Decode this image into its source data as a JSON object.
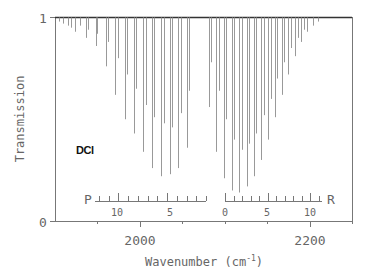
{
  "chart_data": {
    "type": "line",
    "subtype": "stick-spectrum",
    "title": "",
    "annotation": "DCl",
    "xlabel": "Wavenumber",
    "xlabel_unit_base": "cm",
    "xlabel_unit_exp": "-1",
    "ylabel": "Transmission",
    "xlim": [
      1900,
      2250
    ],
    "ylim": [
      0,
      1
    ],
    "x_ticks": [
      1950,
      2000,
      2050,
      2100,
      2150,
      2200,
      2250
    ],
    "x_tick_labels": [
      "2000",
      "2200"
    ],
    "x_tick_label_values": [
      2000,
      2200
    ],
    "y_tick_labels": [
      "0",
      "1"
    ],
    "grid": false,
    "branches": {
      "P": {
        "label": "P",
        "tick_labels": [
          "10",
          "5"
        ],
        "tick_label_J": [
          10,
          5
        ],
        "J_max": 12
      },
      "R": {
        "label": "R",
        "tick_labels": [
          "0",
          "5",
          "10"
        ],
        "tick_label_J": [
          0,
          5,
          10
        ],
        "J_max": 11
      }
    },
    "lines": [
      {
        "x": 1905,
        "t": 0.98
      },
      {
        "x": 1910,
        "t": 0.97
      },
      {
        "x": 1915,
        "t": 0.96
      },
      {
        "x": 1919,
        "t": 0.95
      },
      {
        "x": 1924,
        "t": 0.93
      },
      {
        "x": 1930,
        "t": 0.96
      },
      {
        "x": 1937,
        "t": 0.9
      },
      {
        "x": 1939,
        "t": 0.94
      },
      {
        "x": 1948,
        "t": 0.86
      },
      {
        "x": 1950,
        "t": 0.92
      },
      {
        "x": 1960,
        "t": 0.76
      },
      {
        "x": 1962,
        "t": 0.88
      },
      {
        "x": 1971,
        "t": 0.62
      },
      {
        "x": 1974,
        "t": 0.8
      },
      {
        "x": 1982,
        "t": 0.5
      },
      {
        "x": 1985,
        "t": 0.72
      },
      {
        "x": 1993,
        "t": 0.43
      },
      {
        "x": 1996,
        "t": 0.65
      },
      {
        "x": 2004,
        "t": 0.34
      },
      {
        "x": 2007,
        "t": 0.57
      },
      {
        "x": 2014,
        "t": 0.26
      },
      {
        "x": 2017,
        "t": 0.51
      },
      {
        "x": 2025,
        "t": 0.22
      },
      {
        "x": 2028,
        "t": 0.48
      },
      {
        "x": 2035,
        "t": 0.23
      },
      {
        "x": 2038,
        "t": 0.46
      },
      {
        "x": 2045,
        "t": 0.26
      },
      {
        "x": 2048,
        "t": 0.53
      },
      {
        "x": 2055,
        "t": 0.36
      },
      {
        "x": 2058,
        "t": 0.64
      },
      {
        "x": 2081,
        "t": 0.56
      },
      {
        "x": 2084,
        "t": 0.78
      },
      {
        "x": 2090,
        "t": 0.34
      },
      {
        "x": 2093,
        "t": 0.64
      },
      {
        "x": 2099,
        "t": 0.21
      },
      {
        "x": 2102,
        "t": 0.5
      },
      {
        "x": 2108,
        "t": 0.15
      },
      {
        "x": 2111,
        "t": 0.4
      },
      {
        "x": 2117,
        "t": 0.14
      },
      {
        "x": 2120,
        "t": 0.35
      },
      {
        "x": 2126,
        "t": 0.17
      },
      {
        "x": 2129,
        "t": 0.38
      },
      {
        "x": 2134,
        "t": 0.22
      },
      {
        "x": 2137,
        "t": 0.43
      },
      {
        "x": 2143,
        "t": 0.3
      },
      {
        "x": 2146,
        "t": 0.52
      },
      {
        "x": 2151,
        "t": 0.4
      },
      {
        "x": 2154,
        "t": 0.6
      },
      {
        "x": 2159,
        "t": 0.51
      },
      {
        "x": 2162,
        "t": 0.7
      },
      {
        "x": 2167,
        "t": 0.62
      },
      {
        "x": 2170,
        "t": 0.78
      },
      {
        "x": 2175,
        "t": 0.72
      },
      {
        "x": 2178,
        "t": 0.85
      },
      {
        "x": 2183,
        "t": 0.81
      },
      {
        "x": 2186,
        "t": 0.9
      },
      {
        "x": 2190,
        "t": 0.88
      },
      {
        "x": 2193,
        "t": 0.94
      },
      {
        "x": 2197,
        "t": 0.93
      },
      {
        "x": 2204,
        "t": 0.96
      },
      {
        "x": 2210,
        "t": 0.98
      }
    ]
  }
}
